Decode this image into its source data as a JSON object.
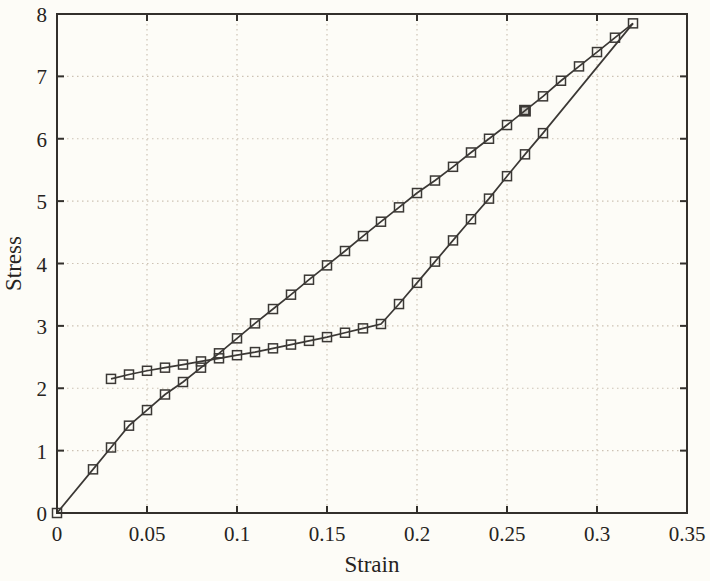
{
  "figure": {
    "background": "#fdfcf7",
    "border_color": "#33302c",
    "curve_color": "#3b3835",
    "grid_color": "#cdc2b4",
    "text_color": "#262321",
    "tick_length": 7
  },
  "chart_data": {
    "type": "line",
    "title": "",
    "xlabel": "Strain",
    "ylabel": "Stress",
    "xlim": [
      0,
      0.35
    ],
    "ylim": [
      0,
      8
    ],
    "xticks": [
      0,
      0.05,
      0.1,
      0.15,
      0.2,
      0.25,
      0.3,
      0.35
    ],
    "xtick_labels": [
      "0",
      "0.05",
      "0.1",
      "0.15",
      "0.2",
      "0.25",
      "0.3",
      "0.35"
    ],
    "yticks": [
      0,
      1,
      2,
      3,
      4,
      5,
      6,
      7,
      8
    ],
    "ytick_labels": [
      "0",
      "1",
      "2",
      "3",
      "4",
      "5",
      "6",
      "7",
      "8"
    ],
    "grid": "dotted",
    "legend": null,
    "marker": "open-square",
    "series": [
      {
        "name": "near-linear branch from origin to peak",
        "marker": "open-square",
        "x": [
          0,
          0.02,
          0.03,
          0.04,
          0.05,
          0.06,
          0.07,
          0.08,
          0.09,
          0.1,
          0.11,
          0.12,
          0.13,
          0.14,
          0.15,
          0.16,
          0.17,
          0.18,
          0.19,
          0.2,
          0.21,
          0.22,
          0.23,
          0.24,
          0.25,
          0.26,
          0.27,
          0.28,
          0.29,
          0.3,
          0.31,
          0.32
        ],
        "y": [
          0,
          0.7,
          1.05,
          1.4,
          1.65,
          1.9,
          2.1,
          2.33,
          2.56,
          2.8,
          3.04,
          3.27,
          3.5,
          3.74,
          3.97,
          4.2,
          4.44,
          4.67,
          4.9,
          5.13,
          5.33,
          5.55,
          5.78,
          6.0,
          6.22,
          6.45,
          6.68,
          6.93,
          7.16,
          7.39,
          7.62,
          7.85
        ],
        "last_marker_index": 31,
        "bold_marker_index": 25
      },
      {
        "name": "plateau branch rising to peak",
        "marker": "open-square",
        "x": [
          0.03,
          0.04,
          0.05,
          0.06,
          0.07,
          0.08,
          0.09,
          0.1,
          0.11,
          0.12,
          0.13,
          0.14,
          0.15,
          0.16,
          0.17,
          0.18,
          0.19,
          0.2,
          0.21,
          0.22,
          0.23,
          0.24,
          0.25,
          0.26,
          0.27,
          0.32
        ],
        "y": [
          2.15,
          2.22,
          2.28,
          2.33,
          2.38,
          2.43,
          2.48,
          2.53,
          2.58,
          2.64,
          2.7,
          2.76,
          2.82,
          2.89,
          2.96,
          3.03,
          3.35,
          3.69,
          4.03,
          4.37,
          4.71,
          5.04,
          5.4,
          5.75,
          6.09,
          7.85
        ],
        "last_marker_index": 24,
        "bold_marker_index": -1
      }
    ]
  }
}
